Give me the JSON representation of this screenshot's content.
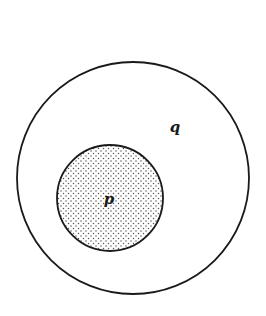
{
  "diagram": {
    "type": "euler",
    "width": 266,
    "height": 316,
    "background": "#ffffff",
    "stroke_color": "#1a1a1a",
    "sets": [
      {
        "name": "q",
        "label": "q",
        "shape": "circle",
        "cx": 133,
        "cy": 178,
        "r": 116,
        "fill": "none",
        "label_x": 175,
        "label_y": 132
      },
      {
        "name": "p",
        "label": "p",
        "shape": "circle",
        "cx": 110,
        "cy": 198,
        "r": 53,
        "fill": "stipple-dots",
        "dot_color": "#555555",
        "label_x": 109,
        "label_y": 204
      }
    ],
    "relation": "p is a subset of q"
  }
}
